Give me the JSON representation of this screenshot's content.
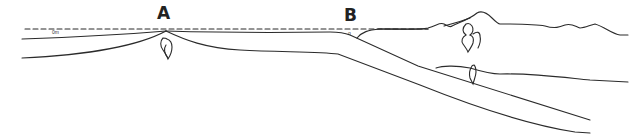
{
  "diagram": {
    "type": "plate tectonics cross-section",
    "labels": {
      "point_a": "A",
      "point_b": "B",
      "sea_level_marker": "0m",
      "trench_marker": "o"
    },
    "features": [
      {
        "name": "sea-level",
        "style": "dashed"
      },
      {
        "name": "mid-ocean-ridge",
        "at": "A"
      },
      {
        "name": "subduction-zone",
        "at": "B"
      },
      {
        "name": "continental-crust",
        "position": "right"
      },
      {
        "name": "magma-chambers",
        "count": 3
      }
    ],
    "colors": {
      "line": "#2b2b2b",
      "background": "#ffffff"
    }
  }
}
